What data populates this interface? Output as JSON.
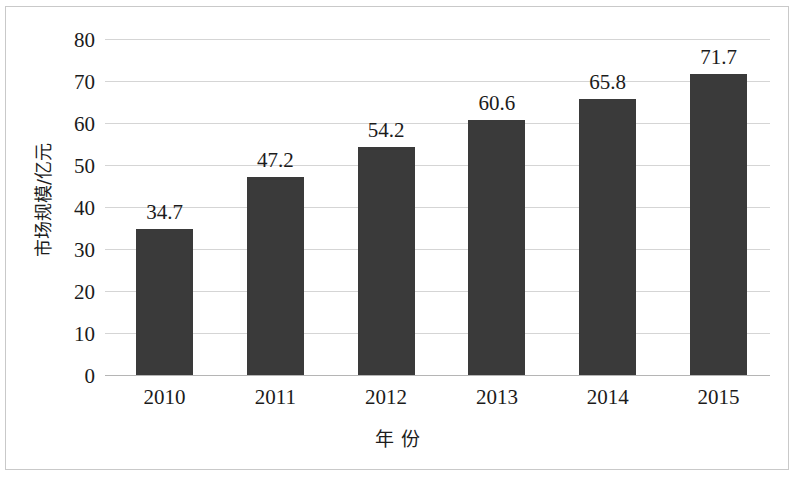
{
  "chart_data": {
    "type": "bar",
    "title": "",
    "subtitle": "",
    "xlabel": "年  份",
    "ylabel": "市场规模/亿元",
    "categories": [
      "2010",
      "2011",
      "2012",
      "2013",
      "2014",
      "2015"
    ],
    "values": [
      34.7,
      47.2,
      54.2,
      60.6,
      65.8,
      71.7
    ],
    "data_labels": [
      "34.7",
      "47.2",
      "54.2",
      "60.6",
      "65.8",
      "71.7"
    ],
    "ylim": [
      0,
      80
    ],
    "ytick_labels": [
      "0",
      "10",
      "20",
      "30",
      "40",
      "50",
      "60",
      "70",
      "80"
    ],
    "ytick_values": [
      0,
      10,
      20,
      30,
      40,
      50,
      60,
      70,
      80
    ],
    "grid": true,
    "legend": "none",
    "series": [
      {
        "name": "市场规模",
        "values": [
          34.7,
          47.2,
          54.2,
          60.6,
          65.8,
          71.7
        ]
      }
    ],
    "colors": {
      "bar": "#3a3a3a",
      "grid": "#d5d5d5",
      "axis": "#b5b5b5",
      "text": "#1b1b1b",
      "background": "#ffffff",
      "frame": "#c9c9c9"
    }
  }
}
